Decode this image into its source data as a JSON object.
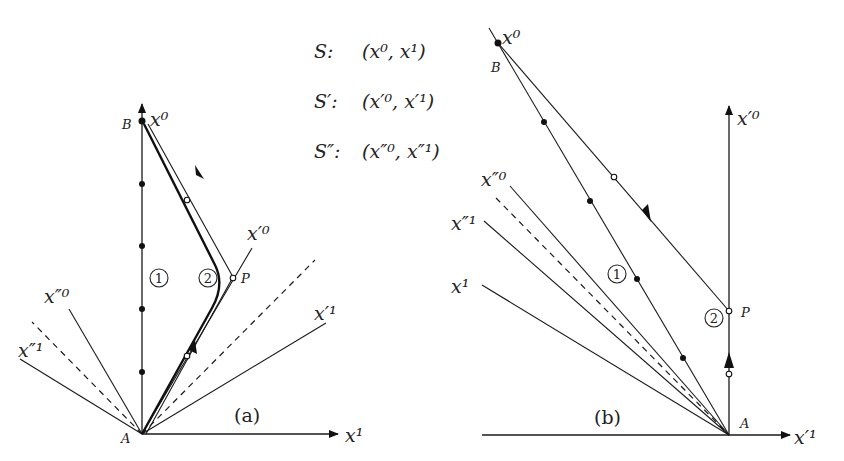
{
  "legend": {
    "s": {
      "name": "S:",
      "coords": "(x⁰, x¹)"
    },
    "s_prime": {
      "name": "S′:",
      "coords": "(x′⁰, x′¹)"
    },
    "s_double": {
      "name": "S″:",
      "coords": "(x″⁰, x″¹)"
    }
  },
  "panel_a": {
    "caption": "(a)",
    "labels": {
      "x0": "x⁰",
      "x1": "x¹",
      "xp0": "x′⁰",
      "xp1": "x′¹",
      "xpp0": "x″⁰",
      "xpp1": "x″¹",
      "A": "A",
      "B": "B",
      "P": "P"
    },
    "worldlines": {
      "one": "1",
      "two": "2"
    }
  },
  "panel_b": {
    "caption": "(b)",
    "labels": {
      "x0": "x⁰",
      "x1": "x¹",
      "xp0": "x′⁰",
      "xp1": "x′¹",
      "xpp0": "x″⁰",
      "xpp1": "x″¹",
      "A": "A",
      "B": "B",
      "P": "P"
    },
    "worldlines": {
      "one": "1",
      "two": "2"
    }
  },
  "colors": {
    "ink": "#1a1a1a",
    "background": "#ffffff"
  }
}
